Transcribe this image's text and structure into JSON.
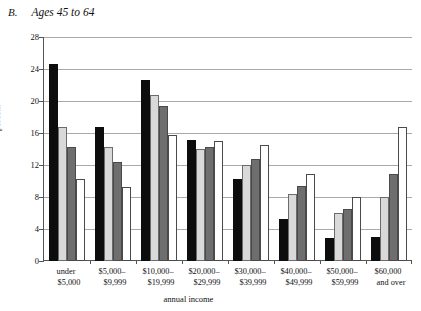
{
  "figure": {
    "panel_letter": "B.",
    "panel_title": "Ages 45 to 64"
  },
  "chart_data": {
    "type": "bar",
    "title": "Ages 45 to 64",
    "xlabel": "annual income",
    "ylabel": "percent",
    "ylim": [
      0,
      28
    ],
    "yticks": [
      0,
      4,
      8,
      12,
      16,
      20,
      24,
      28
    ],
    "grid": true,
    "legend": "none",
    "categories": [
      "under $5,000",
      "$5,000–$9,999",
      "$10,000–$19,999",
      "$20,000–$29,999",
      "$30,000–$39,999",
      "$40,000–$49,999",
      "$50,000–$59,999",
      "$60,000 and over"
    ],
    "category_lines": [
      [
        "under",
        "$5,000"
      ],
      [
        "$5,000–",
        "$9,999"
      ],
      [
        "$10,000–",
        "$19,999"
      ],
      [
        "$20,000–",
        "$29,999"
      ],
      [
        "$30,000–",
        "$39,999"
      ],
      [
        "$40,000–",
        "$49,999"
      ],
      [
        "$50,000–",
        "$59,999"
      ],
      [
        "$60,000",
        "and over"
      ]
    ],
    "series": [
      {
        "name": "series-1",
        "color": "#0d0d0d",
        "fill": "black",
        "values": [
          24.6,
          16.8,
          22.6,
          15.1,
          10.2,
          5.3,
          2.9,
          3.0
        ]
      },
      {
        "name": "series-2",
        "color": "#d9d9d9",
        "fill": "light-gray",
        "values": [
          16.8,
          14.2,
          20.7,
          14.0,
          12.0,
          8.4,
          6.0,
          8.0
        ]
      },
      {
        "name": "series-3",
        "color": "#6e6e6e",
        "fill": "dark-gray",
        "values": [
          14.2,
          12.4,
          19.4,
          14.3,
          12.8,
          9.4,
          6.5,
          10.9
        ]
      },
      {
        "name": "series-4",
        "color": "#ffffff",
        "fill": "white",
        "values": [
          10.3,
          9.2,
          15.8,
          15.0,
          14.5,
          10.9,
          8.0,
          16.8
        ]
      }
    ]
  }
}
